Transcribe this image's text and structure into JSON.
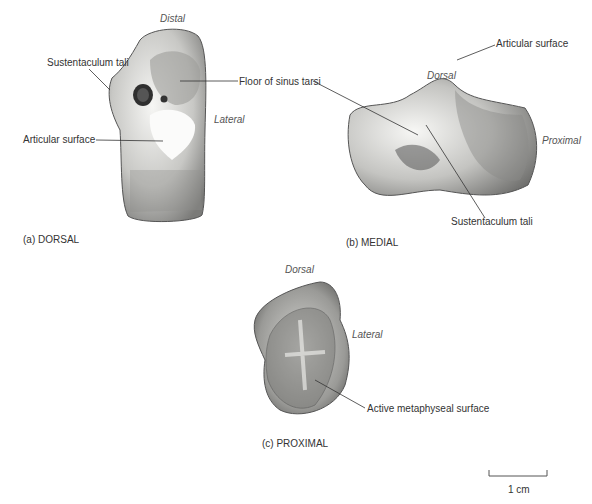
{
  "figure_a": {
    "caption": "(a) DORSAL",
    "labels": {
      "distal": "Distal",
      "sustentaculum": "Sustentaculum tali",
      "floor_sinus": "Floor of sinus tarsi",
      "lateral": "Lateral",
      "articular": "Articular surface"
    }
  },
  "figure_b": {
    "caption": "(b) MEDIAL",
    "labels": {
      "dorsal": "Dorsal",
      "articular": "Articular surface",
      "proximal": "Proximal",
      "sustentaculum": "Sustentaculum tali"
    }
  },
  "figure_c": {
    "caption": "(c) PROXIMAL",
    "labels": {
      "dorsal": "Dorsal",
      "lateral": "Lateral",
      "metaphyseal": "Active metaphyseal surface"
    }
  },
  "scale_bar": {
    "label": "1 cm"
  },
  "colors": {
    "bone_light": "#f2f2f0",
    "bone_mid": "#b9b9b6",
    "bone_dark": "#6a6a68",
    "line": "#333333"
  }
}
